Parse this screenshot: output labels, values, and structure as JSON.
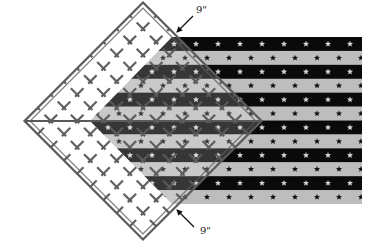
{
  "diagram": {
    "type": "quilting-illustration",
    "labels": {
      "top_measure": "9\"",
      "bottom_measure": "9\""
    },
    "colors": {
      "stripe_dark": "#0a0a0a",
      "stripe_light": "#bdbdbd",
      "star_on_dark": "#d0d0d0",
      "star_on_light": "#111111",
      "ruler_line": "#5a5a5a",
      "arrow": "#111111",
      "background": "#ffffff"
    },
    "fabric": {
      "stripe_count": 12,
      "first_stripe": "dark",
      "top": 37,
      "bottom": 204,
      "right": 362,
      "left_point": [
        90,
        121
      ],
      "left_edge_x": 172
    },
    "ruler": {
      "shape": "square rotated 45 degrees",
      "center": [
        143,
        121
      ],
      "vertices": {
        "top": [
          143,
          4
        ],
        "right": [
          261,
          121
        ],
        "bottom": [
          143,
          239
        ],
        "left": [
          24,
          121
        ]
      },
      "grid_divisions": 9,
      "center_line": "horizontal diagonal"
    },
    "arrows": [
      {
        "name": "top-arrow",
        "from": [
          193,
          16
        ],
        "to": [
          177,
          32
        ]
      },
      {
        "name": "bottom-arrow",
        "from": [
          194,
          227
        ],
        "to": [
          177,
          210
        ]
      }
    ]
  }
}
